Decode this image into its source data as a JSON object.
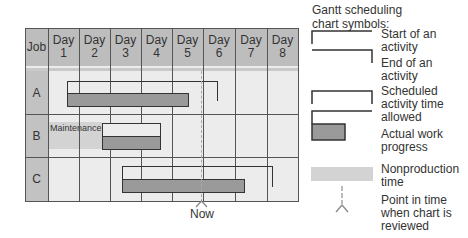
{
  "chart": {
    "columns": {
      "job_header": "Job",
      "days": [
        {
          "label_top": "Day",
          "label_bottom": "1"
        },
        {
          "label_top": "Day",
          "label_bottom": "2"
        },
        {
          "label_top": "Day",
          "label_bottom": "3"
        },
        {
          "label_top": "Day",
          "label_bottom": "4"
        },
        {
          "label_top": "Day",
          "label_bottom": "5"
        },
        {
          "label_top": "Day",
          "label_bottom": "6"
        },
        {
          "label_top": "Day",
          "label_bottom": "7"
        },
        {
          "label_top": "Day",
          "label_bottom": "8"
        }
      ]
    },
    "rows": [
      {
        "job": "A",
        "scheduled_start_day": 1.4,
        "scheduled_end_day": 6.3,
        "actual_start_day": 1.4,
        "actual_end_day": 5.3
      },
      {
        "job": "B",
        "nonproduction_label": "Maintenance",
        "nonproduction_start_day": 0,
        "nonproduction_end_day": 1.75,
        "scheduled_start_day": 1.75,
        "scheduled_end_day": 3.65,
        "actual_start_day": 1.75,
        "actual_end_day": 3.65
      },
      {
        "job": "C",
        "scheduled_start_day": 3.2,
        "scheduled_end_day": 8.1,
        "actual_start_day": 3.2,
        "actual_end_day": 6.2
      }
    ],
    "now_label": "Now",
    "now_day": 5.0
  },
  "legend": {
    "title_line1": "Gantt scheduling",
    "title_line2": "chart symbols:",
    "items": [
      {
        "symbol": "start-bracket",
        "line1": "Start of an",
        "line2": "activity"
      },
      {
        "symbol": "end-bracket",
        "line1": "End of an",
        "line2": "activity"
      },
      {
        "symbol": "scheduled-bracket",
        "line1": "Scheduled",
        "line2": "activity time",
        "line3": "allowed"
      },
      {
        "symbol": "actual-progress-bar",
        "line1": "Actual work",
        "line2": "progress"
      },
      {
        "symbol": "nonproduction-band",
        "line1": "Nonproduction",
        "line2": "time"
      },
      {
        "symbol": "review-point-marker",
        "line1": "Point in time",
        "line2": "when chart is",
        "line3": "reviewed"
      }
    ]
  },
  "colors": {
    "header_bg": "#bdbdbd",
    "body_bg": "#ececec",
    "actual_bar": "#9a9a9a",
    "nonproduction": "#d3d3d3",
    "lines": "#333333"
  }
}
